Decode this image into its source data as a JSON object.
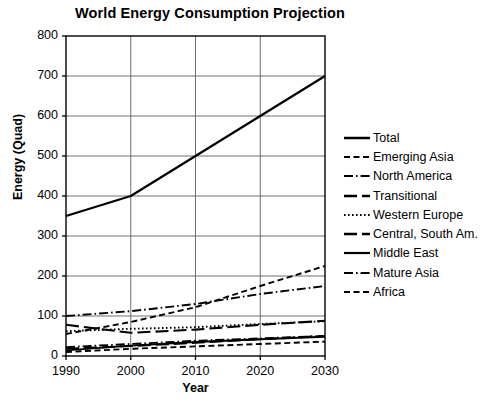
{
  "chart_data": {
    "type": "line",
    "title": "World Energy Consumption Projection",
    "xlabel": "Year",
    "ylabel": "Energy (Quad)",
    "x": [
      1990,
      2000,
      2010,
      2020,
      2030
    ],
    "xlim": [
      1990,
      2030
    ],
    "ylim": [
      0,
      800
    ],
    "xticks": [
      "1990",
      "2000",
      "2010",
      "2020",
      "2030"
    ],
    "yticks": [
      "0",
      "100",
      "200",
      "300",
      "400",
      "500",
      "600",
      "700",
      "800"
    ],
    "grid": true,
    "legend_position": "right",
    "series": [
      {
        "name": "Total",
        "style": "solid",
        "width": 2.2,
        "color": "#000000",
        "values": [
          350,
          400,
          500,
          600,
          700
        ]
      },
      {
        "name": "Emerging Asia",
        "style": "dashed",
        "width": 1.9,
        "color": "#000000",
        "values": [
          55,
          85,
          122,
          175,
          225
        ]
      },
      {
        "name": "North America",
        "style": "dashdot",
        "width": 1.9,
        "color": "#000000",
        "values": [
          100,
          112,
          130,
          155,
          175
        ]
      },
      {
        "name": "Transitional",
        "style": "longdash",
        "width": 2.1,
        "color": "#000000",
        "values": [
          78,
          58,
          66,
          78,
          88
        ]
      },
      {
        "name": "Western Europe",
        "style": "dotted",
        "width": 1.9,
        "color": "#000000",
        "values": [
          62,
          68,
          72,
          80,
          87
        ]
      },
      {
        "name": "Central, South Am.",
        "style": "longdash",
        "width": 2.1,
        "color": "#000000",
        "values": [
          18,
          25,
          33,
          42,
          50
        ]
      },
      {
        "name": "Middle East",
        "style": "solid",
        "width": 1.9,
        "color": "#000000",
        "values": [
          14,
          26,
          35,
          42,
          48
        ]
      },
      {
        "name": "Mature Asia",
        "style": "dashdot",
        "width": 1.9,
        "color": "#000000",
        "values": [
          22,
          30,
          38,
          44,
          50
        ]
      },
      {
        "name": "Africa",
        "style": "dashed",
        "width": 1.9,
        "color": "#000000",
        "values": [
          10,
          18,
          24,
          30,
          36
        ]
      }
    ]
  }
}
